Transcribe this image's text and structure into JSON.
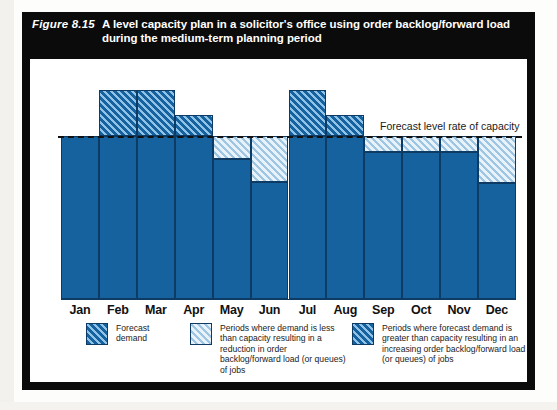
{
  "figure": {
    "number": "Figure 8.15",
    "title": "A level capacity plan in a solicitor's office using order backlog/forward load during the medium-term planning period"
  },
  "annotation": {
    "capacity_line_label": "Forecast level rate of capacity"
  },
  "legend": {
    "items": [
      {
        "swatch": "dark-hatch-swatch",
        "label": "Forecast demand"
      },
      {
        "swatch": "light-hatch-swatch",
        "label": "Periods where demand is less than capacity resulting in a reduction in order backlog/forward load (or queues) of jobs"
      },
      {
        "swatch": "solid-hatch-swatch",
        "label": "Periods where forecast demand is greater than capacity resulting in an increasing order backlog/forward load (or queues) of jobs"
      }
    ]
  },
  "chart_data": {
    "type": "bar",
    "title": "A level capacity plan in a solicitor's office using order backlog/forward load during the medium-term planning period",
    "xlabel": "",
    "ylabel": "",
    "grid": false,
    "legend_position": "below",
    "ylim": [
      0,
      135
    ],
    "capacity_level": 100,
    "capacity_label": "Forecast level rate of capacity",
    "categories": [
      "Jan",
      "Feb",
      "Mar",
      "Apr",
      "May",
      "Jun",
      "Jul",
      "Aug",
      "Sep",
      "Oct",
      "Nov",
      "Dec"
    ],
    "series": [
      {
        "name": "Forecast demand",
        "values": [
          100,
          128,
          128,
          113,
          86,
          72,
          128,
          113,
          90,
          90,
          90,
          71
        ]
      }
    ],
    "segments": [
      {
        "month": "Jan",
        "solid_to": 100,
        "over_from": 100,
        "over_to": 100,
        "under_from": 100,
        "under_to": 100
      },
      {
        "month": "Feb",
        "solid_to": 100,
        "over_from": 100,
        "over_to": 128,
        "under_from": 100,
        "under_to": 100
      },
      {
        "month": "Mar",
        "solid_to": 100,
        "over_from": 100,
        "over_to": 128,
        "under_from": 100,
        "under_to": 100
      },
      {
        "month": "Apr",
        "solid_to": 100,
        "over_from": 100,
        "over_to": 113,
        "under_from": 100,
        "under_to": 100
      },
      {
        "month": "May",
        "solid_to": 86,
        "over_from": 86,
        "over_to": 86,
        "under_from": 86,
        "under_to": 100
      },
      {
        "month": "Jun",
        "solid_to": 72,
        "over_from": 72,
        "over_to": 72,
        "under_from": 72,
        "under_to": 100
      },
      {
        "month": "Jul",
        "solid_to": 100,
        "over_from": 100,
        "over_to": 128,
        "under_from": 100,
        "under_to": 100
      },
      {
        "month": "Aug",
        "solid_to": 100,
        "over_from": 100,
        "over_to": 113,
        "under_from": 100,
        "under_to": 100
      },
      {
        "month": "Sep",
        "solid_to": 90,
        "over_from": 90,
        "over_to": 90,
        "under_from": 90,
        "under_to": 100
      },
      {
        "month": "Oct",
        "solid_to": 90,
        "over_from": 90,
        "over_to": 90,
        "under_from": 90,
        "under_to": 100
      },
      {
        "month": "Nov",
        "solid_to": 90,
        "over_from": 90,
        "over_to": 90,
        "under_from": 90,
        "under_to": 100
      },
      {
        "month": "Dec",
        "solid_to": 71,
        "over_from": 71,
        "over_to": 71,
        "under_from": 71,
        "under_to": 100
      }
    ]
  }
}
